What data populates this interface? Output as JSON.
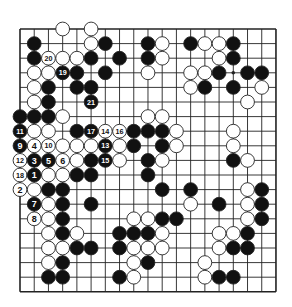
{
  "diagram": {
    "type": "go-board",
    "size": 19,
    "geometry": {
      "x0": 20,
      "y0": 29,
      "dx": 14.22,
      "dy": 14.6,
      "stone_radius": 6.9
    },
    "colors": {
      "line": "#222222",
      "black": "#111111",
      "white": "#ffffff",
      "paper": "#ffffff"
    },
    "hoshi": [
      [
        3,
        3
      ],
      [
        3,
        9
      ],
      [
        3,
        15
      ],
      [
        9,
        3
      ],
      [
        9,
        9
      ],
      [
        9,
        15
      ],
      [
        15,
        3
      ],
      [
        15,
        9
      ],
      [
        15,
        15
      ]
    ],
    "stones": [
      {
        "r": 0,
        "c": 3,
        "color": "W"
      },
      {
        "r": 0,
        "c": 5,
        "color": "W"
      },
      {
        "r": 1,
        "c": 1,
        "color": "B"
      },
      {
        "r": 1,
        "c": 5,
        "color": "W"
      },
      {
        "r": 1,
        "c": 6,
        "color": "B"
      },
      {
        "r": 1,
        "c": 9,
        "color": "B"
      },
      {
        "r": 1,
        "c": 10,
        "color": "W"
      },
      {
        "r": 1,
        "c": 12,
        "color": "B"
      },
      {
        "r": 1,
        "c": 13,
        "color": "W"
      },
      {
        "r": 1,
        "c": 14,
        "color": "W"
      },
      {
        "r": 1,
        "c": 15,
        "color": "B"
      },
      {
        "r": 2,
        "c": 1,
        "color": "B"
      },
      {
        "r": 2,
        "c": 2,
        "color": "W",
        "label": "20"
      },
      {
        "r": 2,
        "c": 3,
        "color": "W"
      },
      {
        "r": 2,
        "c": 4,
        "color": "W"
      },
      {
        "r": 2,
        "c": 5,
        "color": "B"
      },
      {
        "r": 2,
        "c": 7,
        "color": "B"
      },
      {
        "r": 2,
        "c": 9,
        "color": "B"
      },
      {
        "r": 2,
        "c": 10,
        "color": "W"
      },
      {
        "r": 2,
        "c": 14,
        "color": "W"
      },
      {
        "r": 2,
        "c": 15,
        "color": "B"
      },
      {
        "r": 3,
        "c": 1,
        "color": "W"
      },
      {
        "r": 3,
        "c": 2,
        "color": "W"
      },
      {
        "r": 3,
        "c": 3,
        "color": "B",
        "label": "19"
      },
      {
        "r": 3,
        "c": 4,
        "color": "B"
      },
      {
        "r": 3,
        "c": 6,
        "color": "B"
      },
      {
        "r": 3,
        "c": 9,
        "color": "W"
      },
      {
        "r": 3,
        "c": 12,
        "color": "W"
      },
      {
        "r": 3,
        "c": 13,
        "color": "W"
      },
      {
        "r": 3,
        "c": 14,
        "color": "B"
      },
      {
        "r": 3,
        "c": 16,
        "color": "B"
      },
      {
        "r": 3,
        "c": 17,
        "color": "B"
      },
      {
        "r": 4,
        "c": 1,
        "color": "W"
      },
      {
        "r": 4,
        "c": 2,
        "color": "B"
      },
      {
        "r": 4,
        "c": 4,
        "color": "B"
      },
      {
        "r": 4,
        "c": 5,
        "color": "B"
      },
      {
        "r": 4,
        "c": 12,
        "color": "W"
      },
      {
        "r": 4,
        "c": 13,
        "color": "B"
      },
      {
        "r": 4,
        "c": 15,
        "color": "B"
      },
      {
        "r": 4,
        "c": 17,
        "color": "W"
      },
      {
        "r": 5,
        "c": 1,
        "color": "W"
      },
      {
        "r": 5,
        "c": 2,
        "color": "B"
      },
      {
        "r": 5,
        "c": 5,
        "color": "B",
        "label": "21"
      },
      {
        "r": 5,
        "c": 16,
        "color": "W"
      },
      {
        "r": 6,
        "c": 0,
        "color": "B"
      },
      {
        "r": 6,
        "c": 1,
        "color": "B"
      },
      {
        "r": 6,
        "c": 2,
        "color": "B"
      },
      {
        "r": 6,
        "c": 3,
        "color": "W"
      },
      {
        "r": 6,
        "c": 9,
        "color": "W"
      },
      {
        "r": 6,
        "c": 10,
        "color": "W"
      },
      {
        "r": 7,
        "c": 0,
        "color": "B",
        "label": "11"
      },
      {
        "r": 7,
        "c": 1,
        "color": "W"
      },
      {
        "r": 7,
        "c": 2,
        "color": "W"
      },
      {
        "r": 7,
        "c": 4,
        "color": "B"
      },
      {
        "r": 7,
        "c": 5,
        "color": "B",
        "label": "17"
      },
      {
        "r": 7,
        "c": 6,
        "color": "W",
        "label": "14"
      },
      {
        "r": 7,
        "c": 7,
        "color": "W",
        "label": "16"
      },
      {
        "r": 7,
        "c": 8,
        "color": "B"
      },
      {
        "r": 7,
        "c": 9,
        "color": "B"
      },
      {
        "r": 7,
        "c": 10,
        "color": "B"
      },
      {
        "r": 7,
        "c": 11,
        "color": "W"
      },
      {
        "r": 7,
        "c": 15,
        "color": "W"
      },
      {
        "r": 8,
        "c": 0,
        "color": "B",
        "label": "9"
      },
      {
        "r": 8,
        "c": 1,
        "color": "W",
        "label": "4"
      },
      {
        "r": 8,
        "c": 2,
        "color": "W",
        "label": "10"
      },
      {
        "r": 8,
        "c": 3,
        "color": "W"
      },
      {
        "r": 8,
        "c": 4,
        "color": "W"
      },
      {
        "r": 8,
        "c": 5,
        "color": "W"
      },
      {
        "r": 8,
        "c": 6,
        "color": "B",
        "label": "13"
      },
      {
        "r": 8,
        "c": 7,
        "color": "W"
      },
      {
        "r": 8,
        "c": 8,
        "color": "B"
      },
      {
        "r": 8,
        "c": 10,
        "color": "B"
      },
      {
        "r": 8,
        "c": 11,
        "color": "W"
      },
      {
        "r": 8,
        "c": 15,
        "color": "W"
      },
      {
        "r": 9,
        "c": 0,
        "color": "W",
        "label": "12"
      },
      {
        "r": 9,
        "c": 1,
        "color": "B",
        "label": "3"
      },
      {
        "r": 9,
        "c": 2,
        "color": "B",
        "label": "5"
      },
      {
        "r": 9,
        "c": 3,
        "color": "W",
        "label": "6"
      },
      {
        "r": 9,
        "c": 4,
        "color": "W"
      },
      {
        "r": 9,
        "c": 5,
        "color": "B"
      },
      {
        "r": 9,
        "c": 6,
        "color": "B",
        "label": "15"
      },
      {
        "r": 9,
        "c": 7,
        "color": "W"
      },
      {
        "r": 9,
        "c": 9,
        "color": "B"
      },
      {
        "r": 9,
        "c": 10,
        "color": "W"
      },
      {
        "r": 9,
        "c": 15,
        "color": "B"
      },
      {
        "r": 9,
        "c": 16,
        "color": "W"
      },
      {
        "r": 10,
        "c": 0,
        "color": "W",
        "label": "18"
      },
      {
        "r": 10,
        "c": 1,
        "color": "B",
        "label": "1"
      },
      {
        "r": 10,
        "c": 2,
        "color": "W"
      },
      {
        "r": 10,
        "c": 3,
        "color": "W"
      },
      {
        "r": 10,
        "c": 4,
        "color": "B"
      },
      {
        "r": 10,
        "c": 5,
        "color": "B"
      },
      {
        "r": 10,
        "c": 9,
        "color": "B"
      },
      {
        "r": 11,
        "c": 0,
        "color": "W",
        "label": "2"
      },
      {
        "r": 11,
        "c": 1,
        "color": "W"
      },
      {
        "r": 11,
        "c": 2,
        "color": "B"
      },
      {
        "r": 11,
        "c": 3,
        "color": "B"
      },
      {
        "r": 11,
        "c": 10,
        "color": "B"
      },
      {
        "r": 11,
        "c": 12,
        "color": "B"
      },
      {
        "r": 11,
        "c": 16,
        "color": "W"
      },
      {
        "r": 11,
        "c": 17,
        "color": "B"
      },
      {
        "r": 12,
        "c": 1,
        "color": "B",
        "label": "7"
      },
      {
        "r": 12,
        "c": 2,
        "color": "W"
      },
      {
        "r": 12,
        "c": 3,
        "color": "B"
      },
      {
        "r": 12,
        "c": 5,
        "color": "B"
      },
      {
        "r": 12,
        "c": 12,
        "color": "W"
      },
      {
        "r": 12,
        "c": 14,
        "color": "B"
      },
      {
        "r": 12,
        "c": 16,
        "color": "W"
      },
      {
        "r": 12,
        "c": 17,
        "color": "B"
      },
      {
        "r": 13,
        "c": 1,
        "color": "W",
        "label": "8"
      },
      {
        "r": 13,
        "c": 2,
        "color": "W"
      },
      {
        "r": 13,
        "c": 3,
        "color": "B"
      },
      {
        "r": 13,
        "c": 8,
        "color": "W"
      },
      {
        "r": 13,
        "c": 9,
        "color": "W"
      },
      {
        "r": 13,
        "c": 10,
        "color": "B"
      },
      {
        "r": 13,
        "c": 11,
        "color": "B"
      },
      {
        "r": 13,
        "c": 16,
        "color": "W"
      },
      {
        "r": 13,
        "c": 17,
        "color": "B"
      },
      {
        "r": 14,
        "c": 2,
        "color": "W"
      },
      {
        "r": 14,
        "c": 3,
        "color": "B"
      },
      {
        "r": 14,
        "c": 4,
        "color": "W"
      },
      {
        "r": 14,
        "c": 7,
        "color": "B"
      },
      {
        "r": 14,
        "c": 8,
        "color": "B"
      },
      {
        "r": 14,
        "c": 9,
        "color": "B"
      },
      {
        "r": 14,
        "c": 10,
        "color": "W"
      },
      {
        "r": 14,
        "c": 14,
        "color": "W"
      },
      {
        "r": 14,
        "c": 15,
        "color": "W"
      },
      {
        "r": 14,
        "c": 16,
        "color": "B"
      },
      {
        "r": 15,
        "c": 2,
        "color": "W"
      },
      {
        "r": 15,
        "c": 3,
        "color": "W"
      },
      {
        "r": 15,
        "c": 4,
        "color": "B"
      },
      {
        "r": 15,
        "c": 5,
        "color": "B"
      },
      {
        "r": 15,
        "c": 7,
        "color": "B"
      },
      {
        "r": 15,
        "c": 8,
        "color": "W"
      },
      {
        "r": 15,
        "c": 9,
        "color": "W"
      },
      {
        "r": 15,
        "c": 10,
        "color": "W"
      },
      {
        "r": 15,
        "c": 14,
        "color": "W"
      },
      {
        "r": 15,
        "c": 15,
        "color": "B"
      },
      {
        "r": 15,
        "c": 16,
        "color": "B"
      },
      {
        "r": 16,
        "c": 2,
        "color": "W"
      },
      {
        "r": 16,
        "c": 3,
        "color": "B"
      },
      {
        "r": 16,
        "c": 8,
        "color": "W"
      },
      {
        "r": 16,
        "c": 9,
        "color": "B"
      },
      {
        "r": 16,
        "c": 13,
        "color": "W"
      },
      {
        "r": 17,
        "c": 2,
        "color": "B"
      },
      {
        "r": 17,
        "c": 3,
        "color": "B"
      },
      {
        "r": 17,
        "c": 7,
        "color": "B"
      },
      {
        "r": 17,
        "c": 8,
        "color": "W"
      },
      {
        "r": 17,
        "c": 13,
        "color": "W"
      },
      {
        "r": 17,
        "c": 14,
        "color": "B"
      },
      {
        "r": 17,
        "c": 15,
        "color": "B"
      }
    ]
  }
}
